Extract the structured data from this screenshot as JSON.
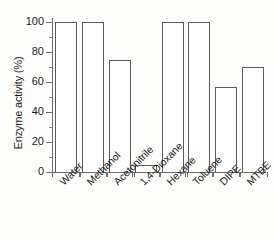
{
  "chart_data": {
    "type": "bar",
    "title": "",
    "xlabel": "",
    "ylabel": "Enzyme activity (%)",
    "categories": [
      "Water",
      "Methanol",
      "Acetonitrile",
      "1,4-Dioxane",
      "Hexane",
      "Toluene",
      "DIPE",
      "MTBE"
    ],
    "values": [
      100,
      100,
      75,
      5,
      100,
      100,
      57,
      70
    ],
    "ylim": [
      0,
      100
    ],
    "yticks": [
      0,
      20,
      40,
      60,
      80,
      100
    ],
    "ytick_labels": [
      "0",
      "20",
      "40",
      "60",
      "80",
      "100"
    ],
    "yminor_ticks": [
      10,
      30,
      50,
      70,
      90
    ],
    "grid": false,
    "legend": false,
    "bar_facecolor": "#ffffff",
    "bar_edgecolor": "#5a5a5a",
    "axis_color": "#6e6e6e",
    "text_color": "#1b1b1b"
  }
}
